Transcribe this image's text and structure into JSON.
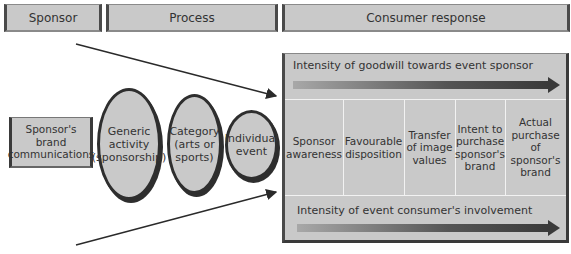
{
  "headers": {
    "sponsor": "Sponsor",
    "process": "Process",
    "consumer_response": "Consumer response"
  },
  "sponsor_box": {
    "line1": "Sponsor's",
    "line2": "brand",
    "line3": "communications"
  },
  "process_ellipses": [
    {
      "line1": "Generic",
      "line2": "activity",
      "line3": "(sponsorship)"
    },
    {
      "line1": "Category",
      "line2": "(arts or",
      "line3": "sports)"
    },
    {
      "line1": "Individual",
      "line2": "event"
    }
  ],
  "response_panel": {
    "top_bar_label": "Intensity of goodwill towards event sponsor",
    "bottom_bar_label": "Intensity of event consumer's involvement",
    "stages": [
      {
        "lines": [
          "Sponsor",
          "awareness"
        ]
      },
      {
        "lines": [
          "Favourable",
          "disposition"
        ]
      },
      {
        "lines": [
          "Transfer",
          "of image",
          "values"
        ]
      },
      {
        "lines": [
          "Intent to",
          "purchase",
          "sponsor's",
          "brand"
        ]
      },
      {
        "lines": [
          "Actual",
          "purchase",
          "of sponsor's",
          "brand"
        ]
      }
    ]
  },
  "colors": {
    "fill_grey": "#c9c9c9",
    "border_dark": "#2e2e2e",
    "arrow_dark": "#2a2a2a"
  }
}
